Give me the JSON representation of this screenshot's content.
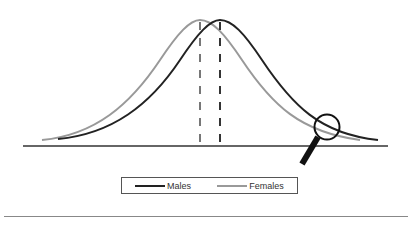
{
  "diagram": {
    "baseline": {
      "x1": 23,
      "x2": 388,
      "y": 146
    },
    "series": [
      {
        "name": "Males",
        "color": "#222222",
        "peak_x": 220,
        "peak_y": 20,
        "start": [
          58,
          139
        ],
        "end": [
          378,
          140
        ]
      },
      {
        "name": "Females",
        "color": "#999999",
        "peak_x": 200,
        "peak_y": 20,
        "start": [
          42,
          140
        ],
        "end": [
          360,
          140
        ]
      }
    ],
    "means_dashed_lines": [
      {
        "x": 200,
        "color": "#777777"
      },
      {
        "x": 220,
        "color": "#333333"
      }
    ],
    "magnifier": {
      "cx": 327,
      "cy": 127,
      "r": 12,
      "note": "highlights right-tail region"
    }
  },
  "legend": {
    "items": [
      {
        "label": "Males",
        "color": "#222222"
      },
      {
        "label": "Females",
        "color": "#999999"
      }
    ]
  }
}
